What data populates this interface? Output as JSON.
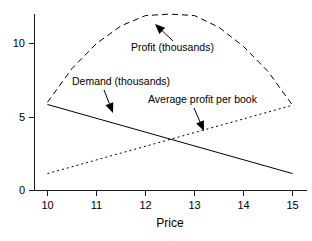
{
  "chart_data": {
    "type": "line",
    "title": "",
    "xlabel": "Price",
    "ylabel": "",
    "xlim": [
      9.75,
      15.25
    ],
    "ylim": [
      0,
      12.6
    ],
    "grid": false,
    "legend_position": "inline-annotations",
    "xticks": [
      10,
      11,
      12,
      13,
      14,
      15
    ],
    "xticklabels": [
      "10",
      "11",
      "12",
      "13",
      "14",
      "15"
    ],
    "yticks": [
      0,
      5,
      10
    ],
    "yticklabels": [
      "0",
      "5",
      "10"
    ],
    "series": [
      {
        "name": "Profit (thousands)",
        "style": "dashed",
        "x": [
          10,
          10.5,
          11,
          11.5,
          12,
          12.5,
          13,
          13.5,
          14,
          14.5,
          15
        ],
        "values": [
          6.0,
          8.3,
          10.0,
          11.2,
          11.9,
          12.0,
          11.9,
          11.1,
          9.8,
          8.1,
          5.8
        ]
      },
      {
        "name": "Demand (thousands)",
        "style": "solid",
        "x": [
          10,
          15
        ],
        "values": [
          5.85,
          1.15
        ]
      },
      {
        "name": "Average profit per book",
        "style": "dotted",
        "x": [
          10,
          15
        ],
        "values": [
          1.15,
          5.8
        ]
      }
    ],
    "annotations": [
      {
        "id": "profit-annotation",
        "text": "Profit (thousands)",
        "text_x": 131,
        "text_y": 51,
        "arrow_from_x": 173,
        "arrow_from_y": 41,
        "arrow_to_x": 155,
        "arrow_to_y": 24
      },
      {
        "id": "demand-annotation",
        "text": "Demand (thousands)",
        "text_x": 72,
        "text_y": 85,
        "arrow_from_x": 104,
        "arrow_from_y": 90,
        "arrow_to_x": 113,
        "arrow_to_y": 113
      },
      {
        "id": "average-profit-annotation",
        "text": "Average profit per book",
        "text_x": 148,
        "text_y": 103,
        "arrow_from_x": 194,
        "arrow_from_y": 108,
        "arrow_to_x": 204,
        "arrow_to_y": 131
      }
    ]
  },
  "colors": {
    "background": "#ffffff",
    "axis": "#1a1a1a",
    "ink": "#000000"
  }
}
